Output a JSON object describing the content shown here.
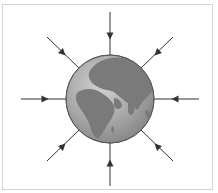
{
  "diagram": {
    "globe": {
      "center": [
        110,
        99
      ],
      "radius": 44,
      "ocean_color": "#a9a9a9",
      "land_color": "#7a7a7a",
      "outline_color": "#5a5a5a"
    },
    "arrows": [
      {
        "direction": "from-top",
        "x1": 110,
        "y1": 12,
        "x2": 110,
        "y2": 55,
        "head": [
          110,
          36
        ]
      },
      {
        "direction": "from-top-right",
        "x1": 173,
        "y1": 37,
        "x2": 141,
        "y2": 68,
        "head": [
          157,
          53
        ]
      },
      {
        "direction": "from-right",
        "x1": 199,
        "y1": 99,
        "x2": 154,
        "y2": 99,
        "head": [
          175,
          99
        ]
      },
      {
        "direction": "from-bottom-right",
        "x1": 173,
        "y1": 161,
        "x2": 141,
        "y2": 130,
        "head": [
          157,
          146
        ]
      },
      {
        "direction": "from-bottom",
        "x1": 110,
        "y1": 186,
        "x2": 110,
        "y2": 143,
        "head": [
          110,
          163
        ]
      },
      {
        "direction": "from-bottom-left",
        "x1": 47,
        "y1": 161,
        "x2": 79,
        "y2": 130,
        "head": [
          63,
          146
        ]
      },
      {
        "direction": "from-left",
        "x1": 21,
        "y1": 99,
        "x2": 66,
        "y2": 99,
        "head": [
          45,
          99
        ]
      },
      {
        "direction": "from-top-left",
        "x1": 47,
        "y1": 37,
        "x2": 79,
        "y2": 68,
        "head": [
          63,
          53
        ]
      }
    ],
    "arrow_color": "#333333",
    "border_color": "#d4d4d4"
  }
}
